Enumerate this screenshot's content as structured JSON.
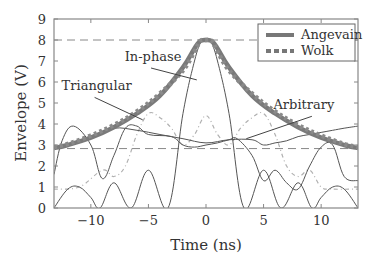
{
  "chart_data": {
    "type": "line",
    "title": "",
    "xlabel": "Time (ns)",
    "ylabel": "Envelope (V)",
    "xlim": [
      -13.2,
      13.2
    ],
    "ylim": [
      0,
      9
    ],
    "xticks": [
      -10,
      -5,
      0,
      5,
      10
    ],
    "yticks": [
      0,
      1,
      2,
      3,
      4,
      5,
      6,
      7,
      8,
      9
    ],
    "xtick_labels": [
      "−10",
      "−5",
      "0",
      "5",
      "10"
    ],
    "ytick_labels": [
      "0",
      "1",
      "2",
      "3",
      "4",
      "5",
      "6",
      "7",
      "8",
      "9"
    ],
    "grid": false,
    "reference_lines": [
      {
        "y": 8,
        "style": "dashed"
      },
      {
        "y": 2.83,
        "style": "dashed"
      }
    ],
    "legend": {
      "position": "upper right",
      "entries": [
        "Angevain",
        "Wolk"
      ]
    },
    "series": [
      {
        "name": "Angevain",
        "style": "thick solid",
        "color": "#777777",
        "x": [
          -13.2,
          -12,
          -10,
          -8,
          -6,
          -4,
          -2,
          -1,
          -0.5,
          0,
          0.5,
          1,
          2,
          4,
          6,
          8,
          10,
          12,
          13.2
        ],
        "y": [
          2.85,
          3.0,
          3.35,
          3.85,
          4.5,
          5.35,
          6.7,
          7.6,
          7.95,
          8.0,
          7.95,
          7.6,
          6.7,
          5.35,
          4.5,
          3.85,
          3.35,
          3.0,
          2.85
        ]
      },
      {
        "name": "Wolk",
        "style": "thick dotted",
        "color": "#777777",
        "x": [
          -13.2,
          -12,
          -10,
          -8,
          -6,
          -4,
          -2,
          -1,
          -0.5,
          0,
          0.5,
          1,
          2,
          4,
          6,
          8,
          10,
          12,
          13.2
        ],
        "y": [
          2.9,
          3.05,
          3.45,
          3.95,
          4.6,
          5.45,
          6.55,
          7.45,
          7.95,
          8.0,
          7.95,
          7.45,
          6.55,
          5.45,
          4.6,
          3.95,
          3.45,
          3.05,
          2.9
        ]
      },
      {
        "name": "In-phase",
        "style": "thin solid",
        "color": "#555555",
        "x": [
          -13.2,
          -12,
          -11,
          -10,
          -9.2,
          -8,
          -6.5,
          -5,
          -3.3,
          -2,
          -1,
          -0.4,
          0,
          0.4,
          1,
          2,
          3.3,
          5,
          6.5,
          8,
          9.2,
          10,
          11,
          12,
          13.2
        ],
        "y": [
          0,
          0.9,
          1.0,
          0.5,
          0,
          1.2,
          0,
          1.8,
          0,
          4.5,
          7.0,
          7.95,
          8.0,
          7.95,
          7.0,
          4.5,
          0,
          1.8,
          0,
          1.2,
          0,
          0.5,
          1.0,
          0.9,
          0
        ]
      },
      {
        "name": "Triangular",
        "style": "thin solid",
        "color": "#555555",
        "x": [
          -13.2,
          -12.5,
          -11.5,
          -10,
          -9,
          -8,
          -7,
          -6,
          -5,
          -3,
          -2,
          -1,
          0,
          1,
          2,
          2.7,
          4,
          5,
          6,
          7,
          8,
          9,
          10,
          11,
          12,
          13.2
        ],
        "y": [
          1.6,
          3.2,
          3.9,
          3.0,
          1.4,
          2.5,
          3.8,
          3.9,
          3.5,
          3.4,
          3.0,
          2.9,
          3.0,
          3.1,
          3.25,
          3.3,
          2.5,
          1.3,
          1.8,
          1.2,
          0.9,
          2.0,
          2.9,
          3.0,
          1.5,
          1.3
        ]
      },
      {
        "name": "Arbitrary",
        "style": "thin solid",
        "color": "#555555",
        "x": [
          -13.2,
          -12,
          -10,
          -8,
          -6,
          -4,
          -2,
          0,
          2,
          4,
          5,
          6,
          7,
          8,
          9,
          10,
          11,
          12,
          13.2
        ],
        "y": [
          2.9,
          3.0,
          3.4,
          3.8,
          3.7,
          3.5,
          3.3,
          3.1,
          3.25,
          3.25,
          3.0,
          3.1,
          3.2,
          3.4,
          3.5,
          3.6,
          3.7,
          3.8,
          3.9
        ]
      },
      {
        "name": "dash-dot",
        "style": "light dash-dot",
        "color": "#aaaaaa",
        "x": [
          -13.2,
          -11,
          -9,
          -8,
          -7,
          -6,
          -5,
          -4,
          -3,
          -2,
          -1,
          0,
          1,
          2,
          3,
          4,
          5,
          6,
          7,
          8,
          9,
          10,
          11,
          13.2
        ],
        "y": [
          0.9,
          1.0,
          1.8,
          1.5,
          2.0,
          3.5,
          4.5,
          4.3,
          3.8,
          3.0,
          3.5,
          4.4,
          3.5,
          3.0,
          3.8,
          4.3,
          4.5,
          3.5,
          2.0,
          1.5,
          1.8,
          1.0,
          0.9,
          0.9
        ]
      }
    ],
    "annotations": [
      {
        "text": "In-phase",
        "x": -4.6,
        "y": 7.0,
        "arrow_to": [
          -0.8,
          6.1
        ]
      },
      {
        "text": "Triangular",
        "x": -9.5,
        "y": 5.6,
        "arrow_to": [
          -5.5,
          4.2
        ]
      },
      {
        "text": "Arbitrary",
        "x": 8.5,
        "y": 4.7,
        "arrow_to": [
          3.5,
          3.3
        ]
      }
    ]
  }
}
